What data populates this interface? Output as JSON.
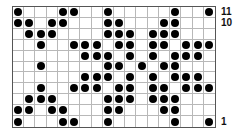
{
  "chart_data": {
    "type": "grid-pattern",
    "title": "",
    "columns": 18,
    "rows": 11,
    "row_numbering": "bottom-to-top",
    "row_labels_shown": [
      {
        "row": 11,
        "label": "11"
      },
      {
        "row": 10,
        "label": "10"
      },
      {
        "row": 1,
        "label": "1"
      }
    ],
    "filled_cells_by_row": {
      "11": [
        1,
        5,
        6,
        9,
        15,
        18
      ],
      "10": [
        1,
        2,
        4,
        5,
        9,
        10,
        14,
        15
      ],
      "9": [
        2,
        3,
        4,
        9,
        10,
        11,
        13,
        14,
        15
      ],
      "8": [
        3,
        6,
        7,
        8,
        10,
        11,
        13,
        14,
        16,
        17,
        18
      ],
      "7": [
        7,
        8,
        9,
        11,
        13,
        15,
        16,
        17
      ],
      "6": [
        3,
        9,
        10,
        12,
        14,
        15
      ],
      "5": [
        7,
        8,
        9,
        11,
        13,
        15,
        16,
        17
      ],
      "4": [
        3,
        6,
        7,
        8,
        10,
        11,
        13,
        14,
        16,
        17,
        18
      ],
      "3": [
        2,
        3,
        4,
        9,
        10,
        11,
        13,
        14,
        15
      ],
      "2": [
        1,
        2,
        4,
        5,
        9,
        10,
        14,
        15
      ],
      "1": [
        1,
        5,
        6,
        9,
        15,
        18
      ]
    },
    "colors": {
      "dot": "#000000",
      "grid_line": "#b8b8b8",
      "border": "#555555",
      "background": "#ffffff"
    }
  }
}
